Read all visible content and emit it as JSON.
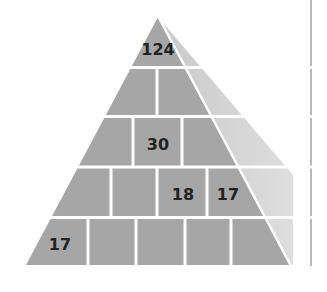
{
  "diagram": {
    "type": "number-pyramid",
    "colors": {
      "brick": "#a6a6a6",
      "shadow": "#d2d2d2",
      "mortar": "#ffffff",
      "border": "#b8b8b8",
      "text": "#222222"
    },
    "rows": [
      {
        "cells": [
          "124"
        ]
      },
      {
        "cells": [
          "",
          ""
        ]
      },
      {
        "cells": [
          "",
          "30",
          ""
        ]
      },
      {
        "cells": [
          "",
          "",
          "18",
          "17"
        ]
      },
      {
        "cells": [
          "17",
          "",
          "",
          "",
          ""
        ]
      }
    ]
  }
}
